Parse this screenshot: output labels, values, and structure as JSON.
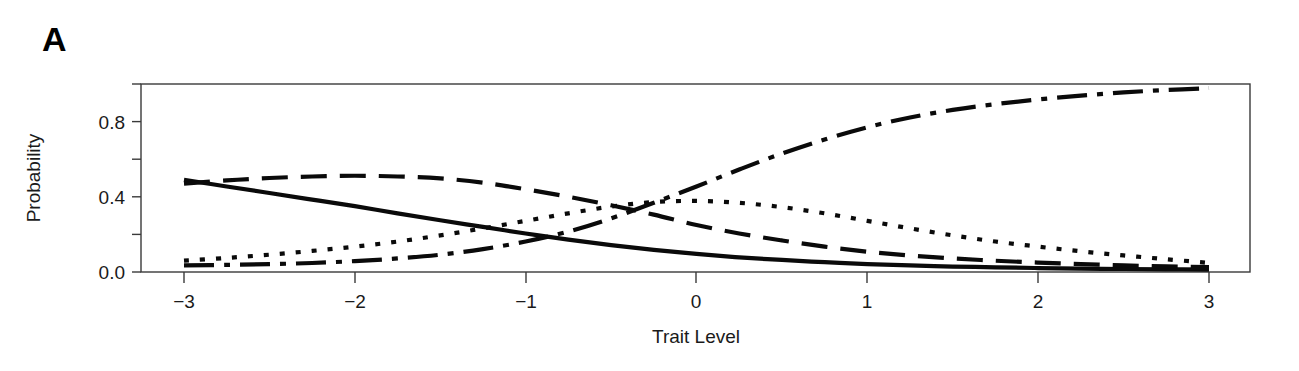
{
  "figure": {
    "panel_label": "A",
    "background": "#ffffff",
    "ink_color": "#0a0a0a",
    "axis_color": "#3a3a3a"
  },
  "chart_data": {
    "type": "line",
    "title": "",
    "subtitle": "",
    "xlabel": "Trait Level",
    "ylabel": "Probability",
    "xlim": [
      -3,
      3
    ],
    "ylim": [
      0.0,
      1.0
    ],
    "xticks": [
      -3,
      -2,
      -1,
      0,
      1,
      2,
      3
    ],
    "xticklabels": [
      "-3",
      "-2",
      "-1",
      "0",
      "1",
      "2",
      "3"
    ],
    "yticks": [
      0.0,
      0.2,
      0.4,
      0.6,
      0.8,
      1.0
    ],
    "yticklabels": [
      "0.0",
      "",
      "0.4",
      "",
      "0.8",
      ""
    ],
    "grid": false,
    "legend": "none",
    "annotations": [
      {
        "name": "panel-label",
        "text": "A",
        "x": 42,
        "y": 22
      }
    ],
    "x": [
      -3.0,
      -2.75,
      -2.5,
      -2.25,
      -2.0,
      -1.75,
      -1.5,
      -1.25,
      -1.0,
      -0.75,
      -0.5,
      -0.25,
      0.0,
      0.25,
      0.5,
      0.75,
      1.0,
      1.25,
      1.5,
      1.75,
      2.0,
      2.25,
      2.5,
      2.75,
      3.0
    ],
    "series": [
      {
        "name": "Category 1",
        "linestyle": "solid",
        "dasharray": "none",
        "values": [
          0.49,
          0.455,
          0.42,
          0.385,
          0.35,
          0.312,
          0.275,
          0.24,
          0.205,
          0.172,
          0.143,
          0.118,
          0.096,
          0.078,
          0.064,
          0.052,
          0.042,
          0.035,
          0.029,
          0.025,
          0.021,
          0.018,
          0.016,
          0.014,
          0.013
        ]
      },
      {
        "name": "Category 2",
        "linestyle": "dashed",
        "dasharray": "26 13",
        "values": [
          0.47,
          0.487,
          0.5,
          0.508,
          0.512,
          0.508,
          0.498,
          0.475,
          0.44,
          0.4,
          0.355,
          0.305,
          0.25,
          0.205,
          0.168,
          0.135,
          0.108,
          0.088,
          0.072,
          0.06,
          0.05,
          0.042,
          0.035,
          0.03,
          0.026
        ]
      },
      {
        "name": "Category 3",
        "linestyle": "dotted",
        "dasharray": "5 11",
        "values": [
          0.06,
          0.075,
          0.092,
          0.112,
          0.135,
          0.162,
          0.195,
          0.232,
          0.272,
          0.312,
          0.348,
          0.372,
          0.378,
          0.368,
          0.345,
          0.312,
          0.272,
          0.232,
          0.195,
          0.162,
          0.135,
          0.11,
          0.088,
          0.068,
          0.048
        ]
      },
      {
        "name": "Category 4",
        "linestyle": "dashdot",
        "dasharray": "30 10 6 10",
        "values": [
          0.035,
          0.038,
          0.042,
          0.048,
          0.058,
          0.072,
          0.092,
          0.122,
          0.162,
          0.215,
          0.285,
          0.368,
          0.455,
          0.545,
          0.63,
          0.705,
          0.77,
          0.822,
          0.862,
          0.893,
          0.918,
          0.938,
          0.955,
          0.968,
          0.978
        ]
      }
    ]
  },
  "plot_geometry": {
    "box_left": 141,
    "box_right": 1250,
    "box_top": 84,
    "box_bottom": 272,
    "x_tick_px": [
      184,
      355,
      526,
      696,
      867,
      1038,
      1209
    ],
    "y_tick_px": [
      272,
      234,
      196,
      159,
      121,
      84
    ]
  }
}
